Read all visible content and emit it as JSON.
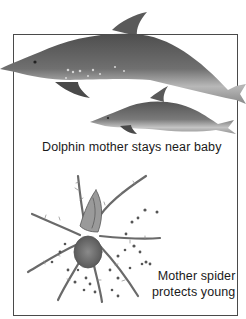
{
  "figure": {
    "panels": [
      {
        "name": "dolphins",
        "caption": "Dolphin mother stays near baby",
        "subjects": [
          "adult-dolphin",
          "baby-dolphin"
        ]
      },
      {
        "name": "spider",
        "caption_line1": "Mother spider",
        "caption_line2": "protects young",
        "subjects": [
          "wolf-spider",
          "spiderlings"
        ]
      }
    ],
    "colors": {
      "frame": "#4a4a4a",
      "dolphin_dark": "#5a5a5a",
      "dolphin_light": "#bdbdbd",
      "spider": "#6a6a6a",
      "text": "#1a1a1a"
    }
  }
}
